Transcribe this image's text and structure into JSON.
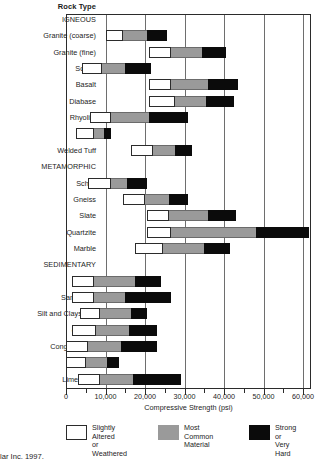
{
  "header": {
    "rock_type_title": "Rock Type"
  },
  "footer": {
    "credit": "lar Inc. 1997."
  },
  "axis": {
    "x_title": "Compressive Strength (psi)",
    "tick_labels": [
      "0",
      "10,000",
      "20,000",
      "30,000",
      "40,000",
      "50,000",
      "60,000"
    ]
  },
  "legend": {
    "items": [
      {
        "key": "light",
        "label": "Slightly Altered\nor Weathered",
        "color": "#ffffff"
      },
      {
        "key": "mid",
        "label": "Most Common\nMaterial",
        "color": "#9a9a9a"
      },
      {
        "key": "dark",
        "label": "Strong or\nVery Hard",
        "color": "#0b0b0b"
      }
    ]
  },
  "chart_data": {
    "type": "bar",
    "orientation": "horizontal",
    "stacked": true,
    "title": "Rock Type",
    "xlabel": "Compressive Strength (psi)",
    "ylabel": "Rock Type",
    "xlim": [
      0,
      62000
    ],
    "grid": true,
    "legend_position": "bottom",
    "series": [
      {
        "name": "Slightly Altered or Weathered",
        "color": "#ffffff"
      },
      {
        "name": "Most Common Material",
        "color": "#9a9a9a"
      },
      {
        "name": "Strong or Very Hard",
        "color": "#0b0b0b"
      }
    ],
    "groups": [
      "IGNEOUS",
      "METAMORPHIC",
      "SEDIMENTARY"
    ],
    "categories": [
      "Granite (coarse)",
      "Granite (fine)",
      "Scoria",
      "Basalt",
      "Diabase",
      "Rhyolite",
      "Tuff",
      "Welded Tuff",
      "Schist",
      "Gneiss",
      "Slate",
      "Quartzite",
      "Marble",
      "Shale",
      "Sandstone",
      "Silt and Claystone",
      "Caliche",
      "Conglomerate",
      "Breccia",
      "Limestone"
    ],
    "bars": [
      {
        "label": "IGNEOUS",
        "group": true
      },
      {
        "label": "Granite (coarse)",
        "start": 20000,
        "light_end": 29000,
        "mid_end": 41000,
        "dark_end": 51000
      },
      {
        "label": "Granite (fine)",
        "start": 42000,
        "light_end": 53000,
        "mid_end": 69000,
        "dark_end": 81000,
        "row_offset": true
      },
      {
        "label": "Scoria",
        "start": 8000,
        "light_end": 18000,
        "mid_end": 30000,
        "dark_end": 43000
      },
      {
        "label": "Basalt",
        "start": 42000,
        "light_end": 53000,
        "mid_end": 72000,
        "dark_end": 87000
      },
      {
        "label": "Diabase",
        "start": 42000,
        "light_end": 55000,
        "mid_end": 71000,
        "dark_end": 85000
      },
      {
        "label": "Rhyolite",
        "start": 12000,
        "light_end": 23000,
        "mid_end": 42000,
        "dark_end": 62000
      },
      {
        "label": "Tuff",
        "start": 5000,
        "light_end": 14000,
        "mid_end": 19000,
        "dark_end": 23000
      },
      {
        "label": "Welded Tuff",
        "start": 33000,
        "light_end": 44000,
        "mid_end": 55000,
        "dark_end": 64000
      },
      {
        "label": "METAMORPHIC",
        "group": true
      },
      {
        "label": "Schist",
        "start": 11000,
        "light_end": 23000,
        "mid_end": 31000,
        "dark_end": 41000
      },
      {
        "label": "Gneiss",
        "start": 29000,
        "light_end": 40000,
        "mid_end": 52000,
        "dark_end": 62000
      },
      {
        "label": "Slate",
        "start": 41000,
        "light_end": 52000,
        "mid_end": 72000,
        "dark_end": 86000
      },
      {
        "label": "Quartzite",
        "start": 41000,
        "light_end": 53000,
        "mid_end": 96000,
        "dark_end": 123000
      },
      {
        "label": "Marble",
        "start": 35000,
        "light_end": 49000,
        "mid_end": 70000,
        "dark_end": 83000
      },
      {
        "label": "SEDIMENTARY",
        "group": true
      },
      {
        "label": "Shale",
        "start": 3000,
        "light_end": 14000,
        "mid_end": 35000,
        "dark_end": 48000
      },
      {
        "label": "Sandstone",
        "start": 3000,
        "light_end": 14000,
        "mid_end": 30000,
        "dark_end": 53000
      },
      {
        "label": "Silt and Claystone",
        "start": 7000,
        "light_end": 17000,
        "mid_end": 33000,
        "dark_end": 41000
      },
      {
        "label": "Caliche",
        "start": 3000,
        "light_end": 15000,
        "mid_end": 32000,
        "dark_end": 46000
      },
      {
        "label": "Conglomerate",
        "start": 0,
        "light_end": 11000,
        "mid_end": 28000,
        "dark_end": 46000
      },
      {
        "label": "Breccia",
        "start": 0,
        "light_end": 10000,
        "mid_end": 21000,
        "dark_end": 27000
      },
      {
        "label": "Limestone",
        "start": 6000,
        "light_end": 17000,
        "mid_end": 34000,
        "dark_end": 58000
      }
    ],
    "rows_psi": [
      {
        "category": "Granite (coarse)",
        "weathered": [
          10000,
          14500
        ],
        "common": [
          14500,
          20500
        ],
        "hard": [
          20500,
          25500
        ]
      },
      {
        "category": "Granite (fine)",
        "weathered": [
          21000,
          26500
        ],
        "common": [
          26500,
          34500
        ],
        "hard": [
          34500,
          40500
        ]
      },
      {
        "category": "Scoria",
        "weathered": [
          4000,
          9000
        ],
        "common": [
          9000,
          15000
        ],
        "hard": [
          15000,
          21500
        ]
      },
      {
        "category": "Basalt",
        "weathered": [
          21000,
          26500
        ],
        "common": [
          26500,
          36000
        ],
        "hard": [
          36000,
          43500
        ]
      },
      {
        "category": "Diabase",
        "weathered": [
          21000,
          27500
        ],
        "common": [
          27500,
          35500
        ],
        "hard": [
          35500,
          42500
        ]
      },
      {
        "category": "Rhyolite",
        "weathered": [
          6000,
          11500
        ],
        "common": [
          11500,
          21000
        ],
        "hard": [
          21000,
          31000
        ]
      },
      {
        "category": "Tuff",
        "weathered": [
          2500,
          7000
        ],
        "common": [
          7000,
          9500
        ],
        "hard": [
          9500,
          11500
        ]
      },
      {
        "category": "Welded Tuff",
        "weathered": [
          16500,
          22000
        ],
        "common": [
          22000,
          27500
        ],
        "hard": [
          27500,
          32000
        ]
      },
      {
        "category": "Schist",
        "weathered": [
          5500,
          11500
        ],
        "common": [
          11500,
          15500
        ],
        "hard": [
          15500,
          20500
        ]
      },
      {
        "category": "Gneiss",
        "weathered": [
          14500,
          20000
        ],
        "common": [
          20000,
          26000
        ],
        "hard": [
          26000,
          31000
        ]
      },
      {
        "category": "Slate",
        "weathered": [
          20500,
          26000
        ],
        "common": [
          26000,
          36000
        ],
        "hard": [
          36000,
          43000
        ]
      },
      {
        "category": "Quartzite",
        "weathered": [
          20500,
          26500
        ],
        "common": [
          26500,
          48000
        ],
        "hard": [
          48000,
          61500
        ]
      },
      {
        "category": "Marble",
        "weathered": [
          17500,
          24500
        ],
        "common": [
          24500,
          35000
        ],
        "hard": [
          35000,
          41500
        ]
      },
      {
        "category": "Shale",
        "weathered": [
          1500,
          7000
        ],
        "common": [
          7000,
          17500
        ],
        "hard": [
          17500,
          24000
        ]
      },
      {
        "category": "Sandstone",
        "weathered": [
          1500,
          7000
        ],
        "common": [
          7000,
          15000
        ],
        "hard": [
          15000,
          26500
        ]
      },
      {
        "category": "Silt and Claystone",
        "weathered": [
          3500,
          8500
        ],
        "common": [
          8500,
          16500
        ],
        "hard": [
          16500,
          20500
        ]
      },
      {
        "category": "Caliche",
        "weathered": [
          1500,
          7500
        ],
        "common": [
          7500,
          16000
        ],
        "hard": [
          16000,
          23000
        ]
      },
      {
        "category": "Conglomerate",
        "weathered": [
          0,
          5500
        ],
        "common": [
          5500,
          14000
        ],
        "hard": [
          14000,
          23000
        ]
      },
      {
        "category": "Breccia",
        "weathered": [
          0,
          5000
        ],
        "common": [
          5000,
          10500
        ],
        "hard": [
          10500,
          13500
        ]
      },
      {
        "category": "Limestone",
        "weathered": [
          3000,
          8500
        ],
        "common": [
          8500,
          17000
        ],
        "hard": [
          17000,
          29000
        ]
      }
    ]
  }
}
